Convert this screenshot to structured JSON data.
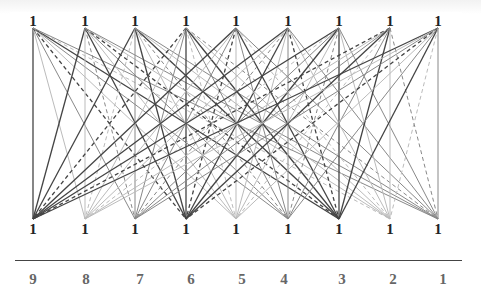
{
  "diagram": {
    "type": "complete bipartite line diagram",
    "top_nodes": {
      "labels": [
        "1",
        "1",
        "1",
        "1",
        "1",
        "1",
        "1",
        "1",
        "1"
      ],
      "x": [
        33,
        85,
        135,
        186,
        236,
        288,
        339,
        390,
        438
      ],
      "y": 28
    },
    "bottom_nodes": {
      "labels": [
        "1",
        "1",
        "1",
        "1",
        "1",
        "1",
        "1",
        "1",
        "1"
      ],
      "x": [
        33,
        85,
        135,
        186,
        236,
        288,
        339,
        390,
        438
      ],
      "y": 219
    },
    "axis_labels": [
      "9",
      "8",
      "7",
      "6",
      "5",
      "4",
      "3",
      "2",
      "1"
    ],
    "axis_label_x": [
      33,
      86,
      140,
      191,
      242,
      284,
      342,
      393,
      443
    ],
    "colors": {
      "dark": "#444444",
      "mid": "#888888",
      "light": "#bbbbbb"
    }
  }
}
